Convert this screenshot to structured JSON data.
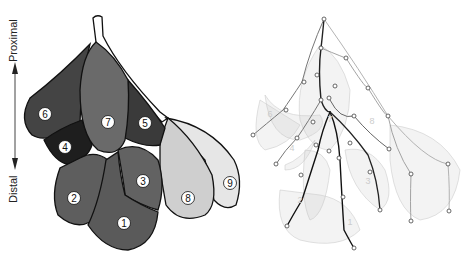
{
  "figure": {
    "left_panel": {
      "axis": {
        "top_label": "Proximal",
        "bottom_label": "Distal"
      },
      "regions": [
        {
          "id": "1",
          "label": "1",
          "shade": "#5a5a5a"
        },
        {
          "id": "2",
          "label": "2",
          "shade": "#5e5e5e"
        },
        {
          "id": "3",
          "label": "3",
          "shade": "#626262"
        },
        {
          "id": "4",
          "label": "4",
          "shade": "#1e1e1e"
        },
        {
          "id": "5",
          "label": "5",
          "shade": "#3a3a3a"
        },
        {
          "id": "6",
          "label": "6",
          "shade": "#444444"
        },
        {
          "id": "7",
          "label": "7",
          "shade": "#6a6a6a"
        },
        {
          "id": "8",
          "label": "8",
          "shade": "#cfcfcf"
        },
        {
          "id": "9",
          "label": "9",
          "shade": "#e6e6e6"
        }
      ]
    },
    "right_panel": {
      "description": "skeleton tree overlay",
      "faint_labels": [
        "6",
        "7",
        "4",
        "2",
        "1",
        "3",
        "8",
        "5"
      ]
    }
  }
}
